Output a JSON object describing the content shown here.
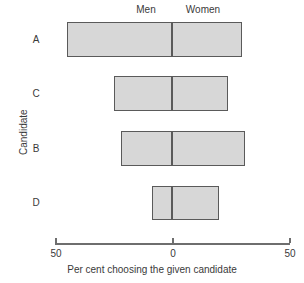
{
  "chart_data": {
    "type": "bar",
    "orientation": "horizontal",
    "style": "diverging-stacked",
    "title": "",
    "xlabel": "Per cent choosing the given candidate",
    "ylabel": "Candidate",
    "categories": [
      "A",
      "C",
      "B",
      "D"
    ],
    "series": [
      {
        "name": "Men",
        "side": "left",
        "values": [
          45,
          25,
          22,
          8.5
        ]
      },
      {
        "name": "Women",
        "side": "right",
        "values": [
          30,
          24,
          31,
          20
        ]
      }
    ],
    "xticks": [
      {
        "value": -50,
        "label": "50"
      },
      {
        "value": 0,
        "label": "0"
      },
      {
        "value": 50,
        "label": "50"
      }
    ],
    "xlim": [
      -50,
      50
    ],
    "grid": false,
    "legend_position": "top",
    "group_labels": [
      {
        "text": "Men",
        "side": "left"
      },
      {
        "text": "Women",
        "side": "right"
      }
    ],
    "colors": {
      "bar_fill": "#d7d7d7",
      "bar_border": "#5a5a5a",
      "axis": "#6e6e6e",
      "text": "#3a3a3a",
      "background": "#ffffff"
    }
  },
  "labels": {
    "men": "Men",
    "women": "Women",
    "candidate_a": "A",
    "candidate_c": "C",
    "candidate_b": "B",
    "candidate_d": "D",
    "y_axis": "Candidate",
    "x_axis": "Per cent choosing the given candidate",
    "tick_left": "50",
    "tick_center": "0",
    "tick_right": "50"
  }
}
